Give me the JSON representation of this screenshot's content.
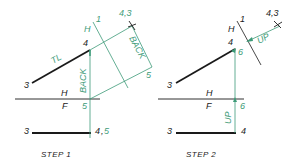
{
  "colors": {
    "ink": "#1a1a1a",
    "construction": "#3d9b78",
    "background": "#ffffff"
  },
  "step1": {
    "caption": "STEP 1",
    "labels": {
      "point3_top": "3",
      "point4_top": "4",
      "true_length": "TL",
      "fold_h": "H",
      "fold_1": "1",
      "point43_aux": "4,3",
      "back_aux": "BACK",
      "back_vertical": "BACK",
      "corner5": "5",
      "fold_hf_h": "H",
      "fold_hf_f": "F",
      "front5": "5",
      "point3_front": "3",
      "point45_front_4": "4",
      "point45_front_sep": ",",
      "point45_front_5": "5"
    }
  },
  "step2": {
    "caption": "STEP 2",
    "labels": {
      "point3_top": "3",
      "point4_top": "4",
      "point6_top": "6",
      "fold_h": "H",
      "fold_1": "1",
      "point43_aux": "4,3",
      "up_aux": "UP",
      "fold_hf_h": "H",
      "fold_hf_f": "F",
      "front6": "6",
      "up_vertical": "UP",
      "point3_front": "3",
      "point4_front": "4"
    }
  }
}
